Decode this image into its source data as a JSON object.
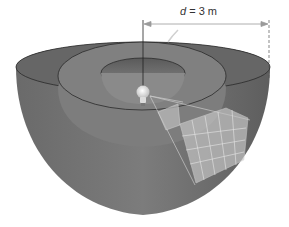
{
  "figure": {
    "dimension_label": {
      "variable": "d",
      "equals": "=",
      "value": "3 m"
    },
    "elements": [
      "outer-hemisphere",
      "middle-hemisphere",
      "inner-hemisphere",
      "light-bulb",
      "grid-patch",
      "light-cone-lines",
      "distance-arrow"
    ],
    "colors": {
      "shell_dark": "#5f5f5f",
      "shell_mid": "#7a7a7a",
      "shell_light": "#8d8d8d",
      "rim_line": "#2a2a2a",
      "grid_patch": "#c8c8c8",
      "bulb": "#f2f2f2"
    }
  }
}
